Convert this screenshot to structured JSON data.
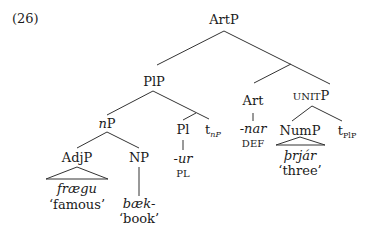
{
  "example_number": "(26)",
  "tree": {
    "root": "ArtP",
    "plp": "PlP",
    "np_small": "n",
    "np_small_p": "P",
    "adjp": "AdjP",
    "adjp_word": "frægu",
    "adjp_gloss": "‘famous’",
    "np": "NP",
    "np_word": "bæk-",
    "np_gloss": "‘book’",
    "pl": "Pl",
    "pl_word": "-ur",
    "pl_gloss": "PL",
    "trace_np": "t",
    "trace_np_sub": "nP",
    "art": "Art",
    "art_word": "-nar",
    "art_gloss": "DEF",
    "unitp_sc": "UNIT",
    "unitp_p": "P",
    "nump": "NumP",
    "nump_word": "þrjár",
    "nump_gloss": "‘three’",
    "trace_plp": "t",
    "trace_plp_sub": "PlP"
  }
}
